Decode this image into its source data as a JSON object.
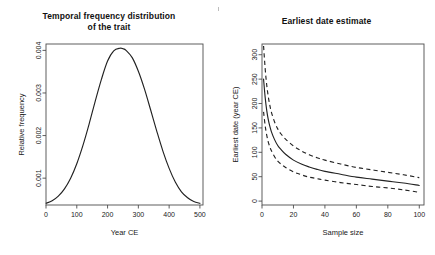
{
  "figure": {
    "background": "#ffffff",
    "foreground": "#222222",
    "axis_color": "#4d4d4d",
    "width": 435,
    "height": 255
  },
  "panels": [
    {
      "id": "temporal-frequency",
      "title_line1": "Temporal frequency distribution",
      "title_line2": "of the trait",
      "xlabel": "Year CE",
      "ylabel": "Relative frequency",
      "x_ticks": [
        "0",
        "100",
        "200",
        "300",
        "400",
        "500"
      ],
      "y_ticks": [
        "0.001",
        "0.002",
        "0.003",
        "0.004"
      ]
    },
    {
      "id": "earliest-date-estimate",
      "title_line1": "Earliest date estimate",
      "title_line2": "",
      "xlabel": "Sample size",
      "ylabel": "Earliest date (year CE)",
      "x_ticks": [
        "0",
        "20",
        "40",
        "60",
        "80",
        "100"
      ],
      "y_ticks": [
        "0",
        "50",
        "100",
        "150",
        "200",
        "250",
        "300"
      ]
    }
  ],
  "chart_data": [
    {
      "type": "line",
      "id": "temporal-frequency",
      "title": "Temporal frequency distribution of the trait",
      "xlabel": "Year CE",
      "ylabel": "Relative frequency",
      "xlim": [
        0,
        510
      ],
      "ylim": [
        0.00037,
        0.00415
      ],
      "xticks": [
        0,
        100,
        200,
        300,
        400,
        500
      ],
      "yticks": [
        0.001,
        0.002,
        0.003,
        0.004
      ],
      "grid": false,
      "legend": "none",
      "series": [
        {
          "name": "Relative frequency of trait",
          "style": "solid",
          "x": [
            0,
            20,
            40,
            60,
            80,
            100,
            120,
            140,
            160,
            180,
            200,
            220,
            240,
            250,
            260,
            280,
            300,
            320,
            340,
            360,
            380,
            400,
            420,
            440,
            460,
            480,
            500
          ],
          "y": [
            0.00041,
            0.00047,
            0.00058,
            0.00075,
            0.001,
            0.00134,
            0.00177,
            0.00227,
            0.00281,
            0.00332,
            0.00375,
            0.00399,
            0.00405,
            0.00404,
            0.004,
            0.00383,
            0.00351,
            0.00309,
            0.0026,
            0.0021,
            0.00163,
            0.00123,
            0.00091,
            0.00068,
            0.00054,
            0.00045,
            0.00041
          ]
        }
      ]
    },
    {
      "type": "line",
      "id": "earliest-date-estimate",
      "title": "Earliest date estimate",
      "xlabel": "Sample size",
      "ylabel": "Earliest date (year CE)",
      "xlim": [
        0,
        103
      ],
      "ylim": [
        -8,
        322
      ],
      "xticks": [
        0,
        20,
        40,
        60,
        80,
        100
      ],
      "yticks": [
        0,
        50,
        100,
        150,
        200,
        250,
        300
      ],
      "grid": false,
      "legend": "none",
      "series": [
        {
          "name": "Upper confidence bound",
          "style": "dashed",
          "x": [
            1,
            2,
            3,
            4,
            5,
            6,
            8,
            10,
            12,
            15,
            20,
            25,
            30,
            35,
            40,
            50,
            60,
            70,
            80,
            90,
            100
          ],
          "y": [
            318,
            272,
            238,
            214,
            196,
            182,
            162,
            148,
            138,
            127,
            113,
            103,
            95,
            89,
            84,
            76,
            69,
            64,
            59,
            54,
            48
          ]
        },
        {
          "name": "Mean earliest date estimate",
          "style": "solid",
          "x": [
            1,
            2,
            3,
            4,
            5,
            6,
            8,
            10,
            12,
            15,
            20,
            25,
            30,
            35,
            40,
            50,
            60,
            70,
            80,
            90,
            100
          ],
          "y": [
            250,
            213,
            186,
            167,
            153,
            142,
            126,
            114,
            106,
            96,
            84,
            76,
            70,
            65,
            61,
            55,
            49,
            45,
            41,
            37,
            32
          ]
        },
        {
          "name": "Lower confidence bound",
          "style": "dashed",
          "x": [
            1,
            2,
            3,
            4,
            5,
            6,
            8,
            10,
            12,
            15,
            20,
            25,
            30,
            35,
            40,
            50,
            60,
            70,
            80,
            90,
            100
          ],
          "y": [
            183,
            155,
            135,
            121,
            111,
            103,
            91,
            82,
            76,
            69,
            60,
            54,
            49,
            46,
            43,
            38,
            34,
            30,
            27,
            23,
            18
          ]
        }
      ]
    }
  ]
}
